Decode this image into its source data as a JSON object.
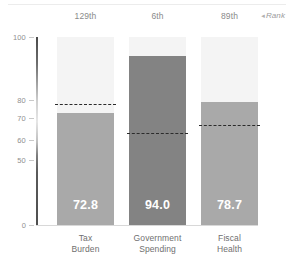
{
  "chart_data": {
    "type": "bar",
    "title": "",
    "subtitle": "",
    "xlabel": "",
    "ylabel": "",
    "ylim": [
      0,
      100
    ],
    "grid": false,
    "legend": "none",
    "categories": [
      "Tax Burden",
      "Government Spending",
      "Fiscal Health"
    ],
    "category_lines": [
      [
        "Tax",
        "Burden"
      ],
      [
        "Government",
        "Spending"
      ],
      [
        "Fiscal",
        "Health"
      ]
    ],
    "values": [
      72.8,
      94.0,
      78.7
    ],
    "value_labels": [
      "72.8",
      "94.0",
      "78.7"
    ],
    "ranks": [
      "129th",
      "6th",
      "89th"
    ],
    "rank_axis_label": "Rank",
    "rank_axis_marker": "◂",
    "reference_lines": {
      "name": "world average",
      "values": [
        77.9,
        63.1,
        66.9
      ],
      "style": "dashed",
      "color": "#2b2b2b"
    },
    "y_ticks": [
      {
        "value": 100,
        "label": "100"
      },
      {
        "value": 80,
        "label": "80"
      },
      {
        "value": 70,
        "label": "70"
      },
      {
        "value": 60,
        "label": "60"
      },
      {
        "value": 50,
        "label": "50"
      },
      {
        "value": 0,
        "label": "0"
      }
    ],
    "bar_colors": [
      "#a9a9a9",
      "#838383",
      "#a9a9a9"
    ],
    "bar_track_color": "#f4f4f4",
    "axis_color": "#5a5a5a",
    "value_label_color": "#ffffff",
    "tick_label_color": "#8f8f8f",
    "category_label_color": "#6f6f6f",
    "rank_label_color": "#8a8a8a"
  }
}
